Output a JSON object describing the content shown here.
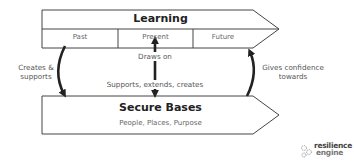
{
  "learning": {
    "title": "Learning",
    "segments": [
      "Past",
      "Present",
      "Future"
    ]
  },
  "secure_bases": {
    "title": "Secure Bases",
    "subtitle": "People,  Places,  Purpose"
  },
  "arrows": {
    "center_up": "Draws on",
    "center_down": "Supports, extends, creates",
    "left_line1": "Creates &",
    "left_line2": "supports",
    "right_line1": "Gives confidence",
    "right_line2": "towards"
  },
  "logo": {
    "line1": "resilience",
    "line2": "engine",
    "icon": "gears-icon"
  },
  "colors": {
    "stroke": "#333333",
    "arrow": "#222222",
    "text": "#555555"
  }
}
